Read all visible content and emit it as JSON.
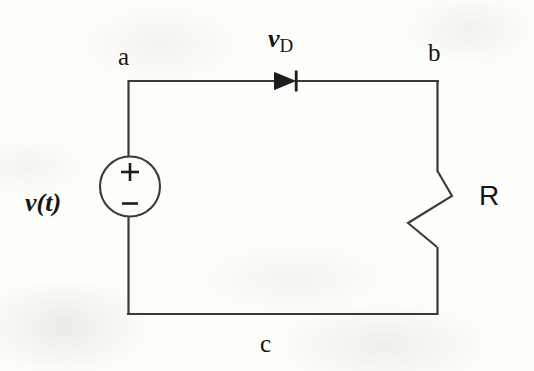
{
  "figure": {
    "kind": "circuit-schematic",
    "background_color": "#fdfdfa",
    "line_color": "#3a3a3a",
    "text_color": "#151515"
  },
  "nodes": {
    "a": "a",
    "b": "b",
    "c": "c"
  },
  "labels": {
    "source": "v(t)",
    "diode_voltage_symbol": "v",
    "diode_voltage_subscript": "D",
    "resistor": "R",
    "polarity_plus": "+",
    "polarity_minus": "−"
  },
  "components": [
    {
      "name": "voltage-source",
      "symbol": "circle-with-plus-minus",
      "label": "v(t)",
      "terminal_top": "a",
      "terminal_bottom": "c"
    },
    {
      "name": "diode",
      "symbol": "triangle-and-bar",
      "label": "v",
      "sublabel": "D",
      "orientation": "left-to-right",
      "between": [
        "a",
        "b"
      ]
    },
    {
      "name": "resistor",
      "symbol": "zigzag",
      "label": "R",
      "between": [
        "b",
        "c"
      ]
    }
  ],
  "geometry": {
    "left_wire_x": 128,
    "right_wire_x": 438,
    "top_wire_y": 81,
    "bottom_wire_y": 314,
    "source_center_x": 130,
    "source_center_y": 186,
    "source_radius": 30,
    "diode_x": 288,
    "resistor_top_y": 170,
    "resistor_bottom_y": 250
  }
}
